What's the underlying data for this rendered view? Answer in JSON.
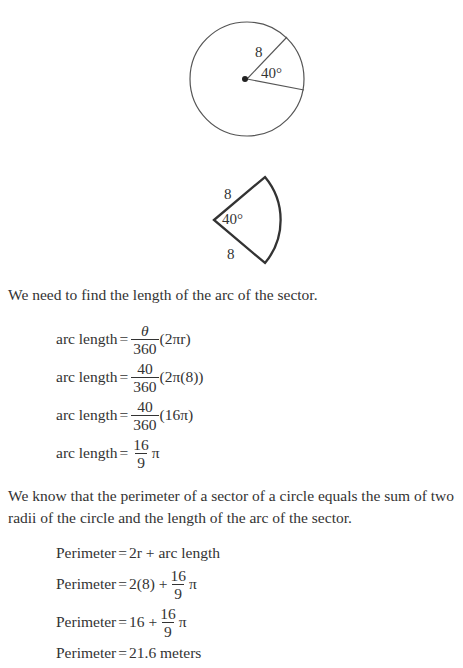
{
  "figure_circle": {
    "radius_label": "8",
    "angle_label": "40°"
  },
  "figure_sector": {
    "top_radius_label": "8",
    "angle_label": "40°",
    "bottom_radius_label": "8"
  },
  "paragraph1": "We need to find the length of the arc of the sector.",
  "arc_equations": [
    {
      "lhs": "arc length",
      "eq": "=",
      "num": "θ",
      "den": "360",
      "rest": "(2πr)"
    },
    {
      "lhs": "arc length",
      "eq": "=",
      "num": "40",
      "den": "360",
      "rest": "(2π(8))"
    },
    {
      "lhs": "arc length",
      "eq": "=",
      "num": "40",
      "den": "360",
      "rest": "(16π)"
    },
    {
      "lhs": "arc length",
      "eq": "=",
      "num": "16",
      "den": "9",
      "rest": "π"
    }
  ],
  "paragraph2": "We know that the perimeter of a sector of a circle equals the sum of two radii of the circle and the length of the arc of the sector.",
  "perimeter_equations": [
    {
      "lhs": "Perimeter",
      "eq": "=",
      "pre": "2r + arc length"
    },
    {
      "lhs": "Perimeter",
      "eq": "=",
      "pre": "2(8) +",
      "num": "16",
      "den": "9",
      "rest": "π"
    },
    {
      "lhs": "Perimeter",
      "eq": "=",
      "pre": "16 +",
      "num": "16",
      "den": "9",
      "rest": "π"
    },
    {
      "lhs": "Perimeter",
      "eq": "=",
      "pre": "21.6 meters"
    }
  ]
}
